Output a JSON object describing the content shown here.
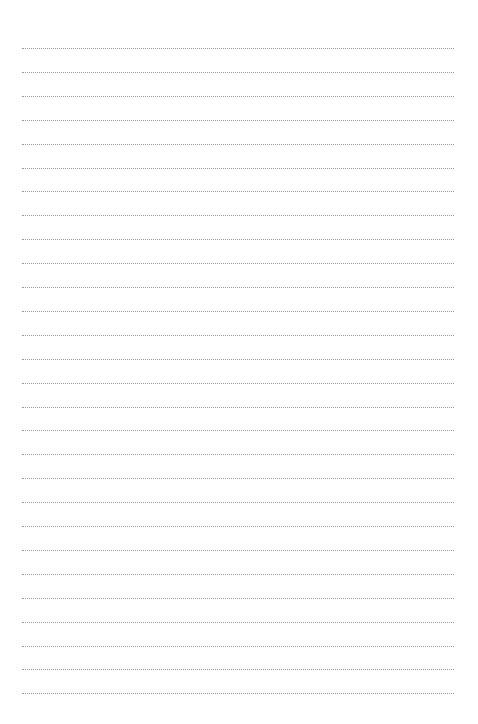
{
  "page": {
    "type": "blank-lined-page",
    "background_color": "#ffffff",
    "rule_color": "#9a9a9a",
    "rule_style": "dotted",
    "rule_count": 28,
    "rule_start_y": 48,
    "rule_spacing": 23.9,
    "rule_left": 22,
    "rule_right": 454
  }
}
